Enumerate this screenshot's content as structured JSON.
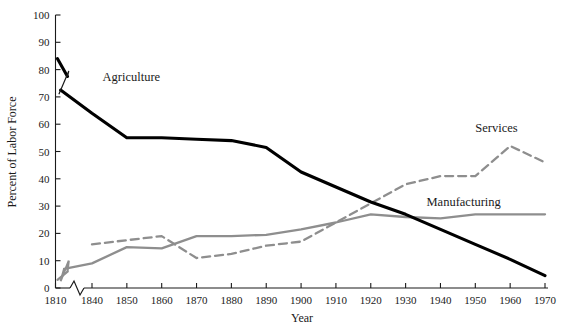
{
  "chart_data": {
    "type": "line",
    "title": "",
    "xlabel": "Year",
    "ylabel": "Percent of Labor Force",
    "xlim": [
      1810,
      1970
    ],
    "ylim": [
      0,
      100
    ],
    "grid": false,
    "legend_position": "inline-labels",
    "axis_break_x": true,
    "x_ticks": [
      1810,
      1840,
      1850,
      1860,
      1870,
      1880,
      1890,
      1900,
      1910,
      1920,
      1930,
      1940,
      1950,
      1960,
      1970
    ],
    "x_tick_labels": [
      "1810",
      "1840",
      "1850",
      "1860",
      "1870",
      "1880",
      "1890",
      "1900",
      "1910",
      "1920",
      "1930",
      "1940",
      "1950",
      "1960",
      "1970"
    ],
    "y_ticks": [
      0,
      10,
      20,
      30,
      40,
      50,
      60,
      70,
      80,
      90,
      100
    ],
    "y_tick_labels": [
      "0",
      "10",
      "20",
      "30",
      "40",
      "50",
      "60",
      "70",
      "80",
      "90",
      "100"
    ],
    "series": [
      {
        "name": "Agriculture",
        "style": "solid",
        "color": "#000000",
        "label_x": 1843,
        "label_y": 76,
        "x": [
          1810,
          1830,
          1840,
          1850,
          1860,
          1870,
          1880,
          1890,
          1900,
          1910,
          1920,
          1930,
          1940,
          1950,
          1960,
          1970
        ],
        "values": [
          84,
          72,
          64,
          55,
          55,
          54.5,
          54,
          51.5,
          42.5,
          37,
          31.5,
          27,
          21.5,
          16,
          10.5,
          4.5
        ]
      },
      {
        "name": "Manufacturing",
        "style": "solid",
        "color": "#8e8e8e",
        "label_x": 1936,
        "label_y": 30,
        "x": [
          1810,
          1830,
          1840,
          1850,
          1860,
          1870,
          1880,
          1890,
          1900,
          1910,
          1920,
          1930,
          1940,
          1950,
          1960,
          1970
        ],
        "values": [
          3,
          7,
          9,
          15,
          14.5,
          19,
          19,
          19.5,
          21.5,
          24,
          27,
          26,
          25.5,
          27,
          27,
          27
        ]
      },
      {
        "name": "Services",
        "style": "dashed",
        "color": "#8e8e8e",
        "label_x": 1950,
        "label_y": 57,
        "x": [
          1840,
          1850,
          1860,
          1870,
          1880,
          1890,
          1900,
          1910,
          1920,
          1930,
          1940,
          1950,
          1960,
          1970
        ],
        "values": [
          16,
          17.5,
          19,
          11,
          12.5,
          15.5,
          17,
          24,
          31,
          38,
          41,
          41,
          52,
          46
        ]
      }
    ]
  },
  "labels": {
    "agriculture": "Agriculture",
    "manufacturing": "Manufacturing",
    "services": "Services",
    "xlabel": "Year",
    "ylabel": "Percent of Labor Force"
  }
}
